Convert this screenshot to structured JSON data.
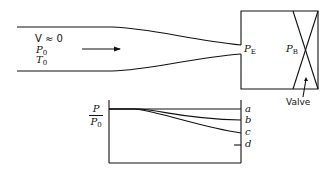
{
  "diagram": {
    "type": "converging-nozzle-flow-schematic",
    "reservoir": {
      "velocity_label": "V ≈ 0",
      "pressure_label": "P",
      "pressure_sub": "0",
      "temperature_label": "T",
      "temperature_sub": "0"
    },
    "exit_pressure": {
      "label": "P",
      "sub": "E"
    },
    "back_pressure": {
      "label": "P",
      "sub": "B"
    },
    "valve_label": "Valve",
    "plot": {
      "ylabel_num": "P",
      "ylabel_den": "P",
      "ylabel_den_sub": "0",
      "curves": [
        "a",
        "b",
        "c",
        "d"
      ]
    },
    "colors": {
      "ink": "#111111",
      "background": "#ffffff"
    }
  }
}
